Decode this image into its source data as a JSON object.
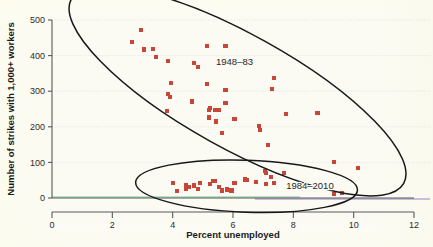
{
  "figure": {
    "background_color": "#fbfbf4",
    "marker_color": "#c8453a",
    "outline_color": "#17181a",
    "grid_color": "#d9dde6"
  },
  "chart_data": {
    "type": "scatter",
    "title": "",
    "subtitle": "",
    "xlabel": "Percent unemployed",
    "ylabel": "Number of strikes with 1,000+ workers",
    "xlim": [
      0,
      12
    ],
    "ylim": [
      0,
      500
    ],
    "xticks": [
      "0",
      "2",
      "4",
      "6",
      "8",
      "10",
      "12"
    ],
    "yticks": [
      "0",
      "100",
      "200",
      "300",
      "400",
      "500"
    ],
    "xtick_values": [
      0,
      2,
      4,
      6,
      8,
      10,
      12
    ],
    "ytick_values": [
      0,
      100,
      200,
      300,
      400,
      500
    ],
    "grid": "horizontal-dotted",
    "legend": "none",
    "marker_shape": "square",
    "marker_color": "#c8453a",
    "annotations": [
      {
        "id": "group-label-1948-83",
        "text": "1948–83",
        "x": 6.05,
        "y": 383
      },
      {
        "id": "group-label-1984-2010",
        "text": "1984–2010",
        "x": 8.55,
        "y": 35
      }
    ],
    "ellipses": [
      {
        "id": "ellipse-1948-83",
        "label": "1948–83",
        "center_x": 6.15,
        "center_y": 300,
        "rx_px": 190,
        "ry_px": 57,
        "rotation_deg": 29
      },
      {
        "id": "ellipse-1984-2010",
        "label": "1984–2010",
        "center_x": 6.45,
        "center_y": 33,
        "rx_px": 111,
        "ry_px": 26,
        "rotation_deg": 2
      }
    ],
    "series": [
      {
        "name": "1948–83",
        "color": "#c8453a",
        "points": [
          [
            2.95,
            473
          ],
          [
            2.65,
            438
          ],
          [
            3.05,
            417
          ],
          [
            3.35,
            419
          ],
          [
            3.45,
            396
          ],
          [
            3.85,
            384
          ],
          [
            5.15,
            426
          ],
          [
            5.75,
            426
          ],
          [
            3.95,
            323
          ],
          [
            3.85,
            292
          ],
          [
            3.9,
            284
          ],
          [
            3.8,
            245
          ],
          [
            4.85,
            368
          ],
          [
            4.7,
            378
          ],
          [
            5.15,
            320
          ],
          [
            5.75,
            303
          ],
          [
            7.3,
            305
          ],
          [
            7.35,
            336
          ],
          [
            4.65,
            271
          ],
          [
            5.25,
            253
          ],
          [
            5.2,
            246
          ],
          [
            5.4,
            247
          ],
          [
            5.75,
            266
          ],
          [
            5.55,
            246
          ],
          [
            5.2,
            226
          ],
          [
            5.45,
            215
          ],
          [
            6.05,
            221
          ],
          [
            5.65,
            183
          ],
          [
            6.85,
            203
          ],
          [
            6.9,
            192
          ],
          [
            7.15,
            149
          ],
          [
            7.75,
            236
          ],
          [
            8.8,
            240
          ],
          [
            7.05,
            77
          ],
          [
            7.1,
            71
          ],
          [
            7.7,
            70
          ],
          [
            9.35,
            102
          ],
          [
            10.15,
            85
          ]
        ]
      },
      {
        "name": "1984–2010",
        "color": "#c8453a",
        "points": [
          [
            4.0,
            41
          ],
          [
            4.15,
            20
          ],
          [
            4.45,
            26
          ],
          [
            4.55,
            31
          ],
          [
            4.45,
            37
          ],
          [
            4.7,
            35
          ],
          [
            4.85,
            25
          ],
          [
            4.9,
            43
          ],
          [
            5.25,
            39
          ],
          [
            5.35,
            48
          ],
          [
            5.4,
            47
          ],
          [
            5.55,
            30
          ],
          [
            5.65,
            21
          ],
          [
            5.8,
            24
          ],
          [
            5.95,
            21
          ],
          [
            6.05,
            43
          ],
          [
            6.4,
            52
          ],
          [
            6.45,
            50
          ],
          [
            6.75,
            45
          ],
          [
            7.1,
            40
          ],
          [
            7.25,
            60
          ],
          [
            7.35,
            41
          ],
          [
            9.35,
            10
          ],
          [
            9.6,
            15
          ]
        ]
      }
    ]
  }
}
